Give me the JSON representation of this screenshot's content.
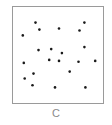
{
  "figure": {
    "caption": "C",
    "dot_color": "#1a1a1a",
    "frame_color": "#9a9a9a"
  },
  "points": [
    {
      "x": 0.25,
      "y": 0.163
    },
    {
      "x": 0.793,
      "y": 0.163
    },
    {
      "x": 0.293,
      "y": 0.235
    },
    {
      "x": 0.511,
      "y": 0.224
    },
    {
      "x": 0.739,
      "y": 0.245
    },
    {
      "x": 0.109,
      "y": 0.296
    },
    {
      "x": 0.793,
      "y": 0.418
    },
    {
      "x": 0.283,
      "y": 0.449
    },
    {
      "x": 0.424,
      "y": 0.439
    },
    {
      "x": 0.543,
      "y": 0.48
    },
    {
      "x": 0.402,
      "y": 0.551
    },
    {
      "x": 0.511,
      "y": 0.561
    },
    {
      "x": 0.728,
      "y": 0.571
    },
    {
      "x": 0.913,
      "y": 0.561
    },
    {
      "x": 0.12,
      "y": 0.582
    },
    {
      "x": 0.63,
      "y": 0.673
    },
    {
      "x": 0.228,
      "y": 0.694
    },
    {
      "x": 0.13,
      "y": 0.745
    },
    {
      "x": 0.217,
      "y": 0.816
    },
    {
      "x": 0.467,
      "y": 0.837
    },
    {
      "x": 0.804,
      "y": 0.837
    }
  ]
}
